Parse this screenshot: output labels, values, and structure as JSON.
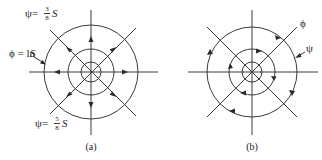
{
  "panels": [
    {
      "id": "a",
      "caption": "(a)",
      "center": [
        91,
        72
      ],
      "radii": [
        10,
        23,
        47
      ],
      "labels": {
        "psi_top": {
          "prefix": "ψ=",
          "num": "3",
          "den": "8",
          "suffix": "S"
        },
        "phi": {
          "text": "ϕ = ln",
          "var": "S"
        },
        "psi_bottom": {
          "prefix": "ψ=",
          "num": "5",
          "den": "8",
          "suffix": "S"
        }
      },
      "flow": "radial-outward"
    },
    {
      "id": "b",
      "caption": "(b)",
      "center": [
        252,
        72
      ],
      "radii": [
        10,
        23,
        45
      ],
      "labels": {
        "phi": {
          "text": "ϕ"
        },
        "psi": {
          "text": "ψ"
        }
      },
      "flow": "clockwise"
    }
  ],
  "colors": {
    "stroke": "#3a3a3a",
    "text": "#222222",
    "background": "#ffffff"
  }
}
